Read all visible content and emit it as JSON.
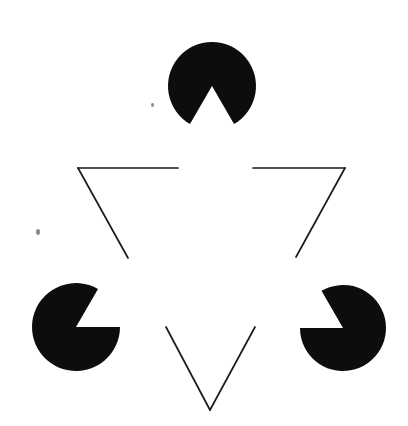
{
  "figure": {
    "name": "kanizsa-triangle-illusion",
    "canvas": {
      "width": 408,
      "height": 426
    },
    "background_color": "#ffffff",
    "ink_color": "#0d0d0d",
    "outline_color": "#1a1a1a",
    "outline_stroke_width": 1.7,
    "speck_color": "#8d8d8d",
    "illusory_shape": "upright-triangle",
    "inducer_shape": "disc-with-wedge",
    "inducer_count": 3,
    "wedge_angle_degrees": 60
  },
  "inducers": [
    {
      "id": "top",
      "label": "top-pacman",
      "center_x": 212,
      "center_y": 86,
      "radius": 44,
      "wedge_start_deg": 60,
      "wedge_end_deg": 120,
      "opening_direction": "down",
      "fill": "#0d0d0d"
    },
    {
      "id": "bottom-left",
      "label": "bottom-left-pacman",
      "center_x": 76,
      "center_y": 327,
      "radius": 44,
      "wedge_start_deg": -60,
      "wedge_end_deg": 0,
      "opening_direction": "upper-right",
      "fill": "#0d0d0d"
    },
    {
      "id": "bottom-right",
      "label": "bottom-right-pacman",
      "center_x": 343,
      "center_y": 328,
      "radius": 43,
      "wedge_start_deg": 180,
      "wedge_end_deg": 240,
      "opening_direction": "upper-left",
      "fill": "#0d0d0d"
    }
  ],
  "outline_triangle": {
    "label": "inverted-outline-triangle",
    "orientation": "inverted",
    "vertices": [
      {
        "x": 78,
        "y": 168
      },
      {
        "x": 345,
        "y": 168
      },
      {
        "x": 210,
        "y": 410
      }
    ],
    "segments": [
      {
        "name": "top-left-run",
        "x1": 78,
        "y1": 168,
        "x2": 178,
        "y2": 168
      },
      {
        "name": "top-right-run",
        "x1": 253,
        "y1": 168,
        "x2": 345,
        "y2": 168
      },
      {
        "name": "left-edge-upper",
        "x1": 78,
        "y1": 168,
        "x2": 128,
        "y2": 258
      },
      {
        "name": "right-edge-upper",
        "x1": 345,
        "y1": 168,
        "x2": 296,
        "y2": 257
      },
      {
        "name": "left-edge-lower",
        "x1": 166,
        "y1": 327,
        "x2": 210,
        "y2": 410
      },
      {
        "name": "right-edge-lower",
        "x1": 255,
        "y1": 327,
        "x2": 210,
        "y2": 410
      }
    ]
  },
  "specks": [
    {
      "name": "speck-upper",
      "x": 152,
      "y": 104,
      "size": 3
    },
    {
      "name": "speck-left",
      "x": 38,
      "y": 231,
      "size": 4
    }
  ]
}
